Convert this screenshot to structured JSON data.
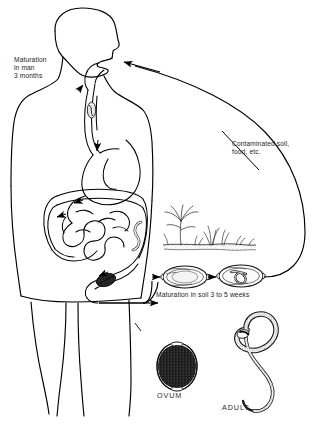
{
  "figure": {
    "background_color": "#ffffff",
    "ink_color": "#000000"
  },
  "labels": {
    "maturation_in_man": "Maturation\nin man\n3 months",
    "contaminated": "Contaminated soil,\nfood, etc.",
    "maturation_in_soil": "Maturation in soil 3 to 5 weeks",
    "ovum": "OVUM",
    "adult": "ADULT"
  },
  "illustrations": {
    "human_body": "human-torso-profile-outline",
    "digestive_tract": "esophagus-stomach-intestine-colon-rectum",
    "larva_in_esophagus": "migrating-larva",
    "larva_in_colon": "attached-adult-worm",
    "soil_scene": "soil-ground-with-grass-and-plant",
    "egg_unembryonated": "ovum-unsegmented",
    "egg_embryonated": "ovum-with-coiled-larva",
    "ovum_detail": "barrel-shaped-egg-with-polar-plugs",
    "adult_detail": "sinuous-whipworm"
  },
  "flow": {
    "arrow_mouth": "ingestion-into-mouth",
    "arrow_rectum_to_egg": "eggs-passed-in-feces",
    "arrow_egg_to_egg": "egg-embryonation-in-soil",
    "curve_soil_to_mouth": "return-route-contaminated-soil-food"
  }
}
